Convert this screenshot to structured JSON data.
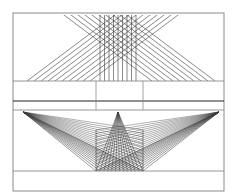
{
  "diagram": {
    "kind": "perspective-construction",
    "width": 238,
    "height": 196,
    "colors": {
      "background": "#ffffff",
      "frame": "#8a8a8a",
      "line": "#3a3a3a",
      "heavy": "#222222"
    },
    "frame": {
      "x": 13,
      "y": 13,
      "w": 211,
      "h": 178
    },
    "horizontals": [
      81,
      101,
      110,
      171
    ],
    "verticals": {
      "x": [
        96,
        143
      ],
      "y1": 81,
      "y2": 110
    },
    "top_panel": {
      "baseline_y": 81,
      "grid_box": {
        "x1": 96,
        "x2": 143,
        "y1": 32,
        "y2": 81
      },
      "vertical_lines": {
        "x_start": 100,
        "x_end": 138,
        "step": 4.5,
        "y1": 15,
        "y2": 81
      },
      "left_diagonals": {
        "x_start": 27,
        "count": 10,
        "step": 7,
        "rise_over_run": 0.75
      },
      "right_diagonals": {
        "x_start": 215,
        "count": 10,
        "step": 7,
        "rise_over_run": 0.75
      }
    },
    "bottom_panel": {
      "top_y": 110,
      "bottom_y": 171,
      "grid_box": {
        "x1": 96,
        "x2": 143,
        "y1": 130,
        "y2": 171
      },
      "apexes": [
        {
          "name": "left",
          "x": 23,
          "y": 112
        },
        {
          "name": "center",
          "x": 118,
          "y": 112
        },
        {
          "name": "right",
          "x": 219,
          "y": 112
        }
      ],
      "rays_per_apex": 12
    }
  }
}
